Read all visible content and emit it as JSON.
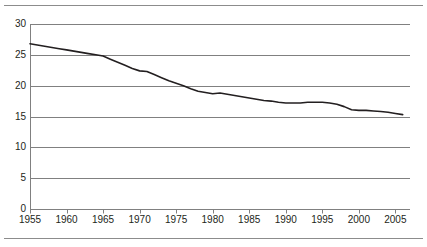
{
  "figure": {
    "name": "line-chart-figure",
    "has_top_rule": true,
    "has_bottom_rule": true,
    "rule_color": "#8c8c8c",
    "background": "#ffffff"
  },
  "chart_data": {
    "type": "line",
    "title": "",
    "subtitle": "",
    "xlabel": "",
    "ylabel": "",
    "xlim": [
      1955,
      2007
    ],
    "ylim": [
      0,
      30
    ],
    "grid": true,
    "grid_axis": "y",
    "grid_color": "#808080",
    "legend": false,
    "legend_position": "none",
    "line_color": "#231f20",
    "line_width": 1.6,
    "y_ticks": [
      0,
      5,
      10,
      15,
      20,
      25,
      30
    ],
    "y_tick_labels": [
      "0",
      "5",
      "10",
      "15",
      "20",
      "25",
      "30"
    ],
    "x_ticks": [
      1955,
      1960,
      1965,
      1970,
      1975,
      1980,
      1985,
      1990,
      1995,
      2000,
      2005
    ],
    "x_tick_labels": [
      "1955",
      "1960",
      "1965",
      "1970",
      "1975",
      "1980",
      "1985",
      "1990",
      "1995",
      "2000",
      "2005"
    ],
    "series": [
      {
        "name": "series-1",
        "x": [
          1955,
          1956,
          1957,
          1958,
          1959,
          1960,
          1961,
          1962,
          1963,
          1964,
          1965,
          1966,
          1967,
          1968,
          1969,
          1970,
          1971,
          1972,
          1973,
          1974,
          1975,
          1976,
          1977,
          1978,
          1979,
          1980,
          1981,
          1982,
          1983,
          1984,
          1985,
          1986,
          1987,
          1988,
          1989,
          1990,
          1991,
          1992,
          1993,
          1994,
          1995,
          1996,
          1997,
          1998,
          1999,
          2000,
          2001,
          2002,
          2003,
          2004,
          2005,
          2006
        ],
        "values": [
          26.8,
          26.6,
          26.4,
          26.2,
          26.0,
          25.8,
          25.6,
          25.4,
          25.2,
          25.0,
          24.8,
          24.3,
          23.8,
          23.3,
          22.8,
          22.4,
          22.3,
          21.8,
          21.3,
          20.8,
          20.4,
          20.0,
          19.5,
          19.1,
          18.9,
          18.7,
          18.8,
          18.6,
          18.4,
          18.2,
          18.0,
          17.8,
          17.6,
          17.5,
          17.3,
          17.2,
          17.2,
          17.2,
          17.3,
          17.3,
          17.3,
          17.2,
          17.0,
          16.6,
          16.1,
          16.0,
          16.0,
          15.9,
          15.8,
          15.7,
          15.5,
          15.3
        ]
      }
    ]
  }
}
